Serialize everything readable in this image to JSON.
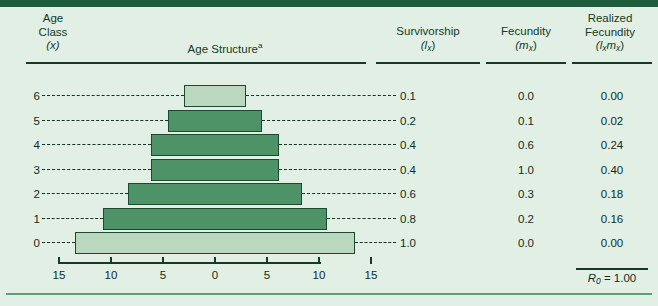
{
  "figure": {
    "header": {
      "age_class_line1": "Age",
      "age_class_line2": "Class",
      "age_class_line3": "(x)",
      "age_structure": "Age Structure",
      "age_structure_footnote": "a",
      "survivorship_line1": "Survivorship",
      "survivorship_line2": "(l",
      "survivorship_sub": "x",
      "survivorship_line2_end": ")",
      "fecundity_line1": "Fecundity",
      "fecundity_line2": "(m",
      "fecundity_sub": "x",
      "fecundity_line2_end": ")",
      "realized_line1": "Realized",
      "realized_line2": "Fecundity",
      "realized_line3_open": "(l",
      "realized_sub1": "x",
      "realized_mid": "m",
      "realized_sub2": "x",
      "realized_close": ")"
    },
    "rows": [
      {
        "age_class": "6",
        "lx": "0.1",
        "mx": "0.0",
        "lxmx": "0.00",
        "bar_left": -3.0,
        "bar_right": 3.0,
        "bar_shade": "pale"
      },
      {
        "age_class": "5",
        "lx": "0.2",
        "mx": "0.1",
        "lxmx": "0.02",
        "bar_left": -4.5,
        "bar_right": 4.5,
        "bar_shade": "dark"
      },
      {
        "age_class": "4",
        "lx": "0.4",
        "mx": "0.6",
        "lxmx": "0.24",
        "bar_left": -6.2,
        "bar_right": 6.2,
        "bar_shade": "dark"
      },
      {
        "age_class": "3",
        "lx": "0.4",
        "mx": "1.0",
        "lxmx": "0.40",
        "bar_left": -6.2,
        "bar_right": 6.2,
        "bar_shade": "dark"
      },
      {
        "age_class": "2",
        "lx": "0.6",
        "mx": "0.3",
        "lxmx": "0.18",
        "bar_left": -8.4,
        "bar_right": 8.4,
        "bar_shade": "dark"
      },
      {
        "age_class": "1",
        "lx": "0.8",
        "mx": "0.2",
        "lxmx": "0.16",
        "bar_left": -10.8,
        "bar_right": 10.8,
        "bar_shade": "dark"
      },
      {
        "age_class": "0",
        "lx": "1.0",
        "mx": "0.0",
        "lxmx": "0.00",
        "bar_left": -13.5,
        "bar_right": 13.5,
        "bar_shade": "pale"
      }
    ],
    "axis": {
      "ticks": [
        {
          "value": -15,
          "label": "15"
        },
        {
          "value": -10,
          "label": "10"
        },
        {
          "value": -5,
          "label": "5"
        },
        {
          "value": 0,
          "label": "0"
        },
        {
          "value": 5,
          "label": "5"
        },
        {
          "value": 10,
          "label": "10"
        },
        {
          "value": 15,
          "label": "15"
        }
      ]
    },
    "footer": {
      "r0_symbol": "R",
      "r0_sub": "0",
      "r0_equals": " = 1.00"
    },
    "colors": {
      "background": "#e2efe4",
      "top_rule": "#1d5c3c",
      "bar_dark": "#4e9368",
      "bar_pale": "#b9d8bf",
      "bar_stroke": "#1b4a31",
      "text": "#143a28"
    }
  },
  "chart_data": {
    "type": "bar",
    "title": "Age Structure",
    "xlabel": "",
    "ylabel": "Age Class (x)",
    "xlim": [
      -15,
      15
    ],
    "grid": false,
    "categories": [
      "6",
      "5",
      "4",
      "3",
      "2",
      "1",
      "0"
    ],
    "series": [
      {
        "name": "Age structure (half-width, % of population per side)",
        "values": [
          3.0,
          4.5,
          6.2,
          6.2,
          8.4,
          10.8,
          13.5
        ]
      },
      {
        "name": "Survivorship (lx)",
        "values": [
          0.1,
          0.2,
          0.4,
          0.4,
          0.6,
          0.8,
          1.0
        ]
      },
      {
        "name": "Fecundity (mx)",
        "values": [
          0.0,
          0.1,
          0.6,
          1.0,
          0.3,
          0.2,
          0.0
        ]
      },
      {
        "name": "Realized Fecundity (lxmx)",
        "values": [
          0.0,
          0.02,
          0.24,
          0.4,
          0.18,
          0.16,
          0.0
        ]
      }
    ],
    "annotations": [
      "R0 = 1.00"
    ]
  }
}
